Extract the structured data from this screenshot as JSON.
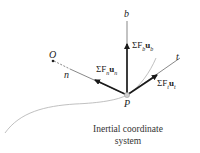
{
  "diagram": {
    "axes": {
      "b": "b",
      "n": "n",
      "t": "t"
    },
    "points": {
      "origin": "O",
      "particle": "P"
    },
    "forces": {
      "binormal": "ΣF_b u_b",
      "normal": "ΣF_n u_n",
      "tangential": "ΣF_t u_t"
    },
    "caption": {
      "line1": "Inertial coordinate",
      "line2": "system"
    },
    "colors": {
      "arrow": "#1a1a1a",
      "axis": "#555555",
      "curve": "#b0b0b0",
      "particle": "#c8c8c8"
    }
  }
}
